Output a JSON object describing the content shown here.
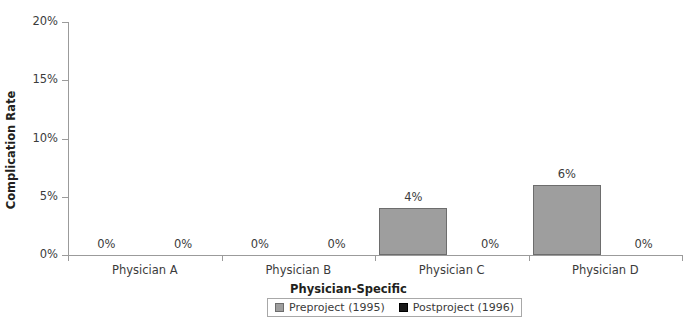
{
  "chart_data": {
    "type": "bar",
    "title": "",
    "xlabel": "Physician-Specific",
    "ylabel": "Complication Rate",
    "categories": [
      "Physician A",
      "Physician B",
      "Physician C",
      "Physician D"
    ],
    "series": [
      {
        "name": "Preproject (1995)",
        "color": "#9e9e9e",
        "values": [
          0,
          0,
          4,
          6
        ],
        "labels": [
          "0%",
          "0%",
          "4%",
          "6%"
        ]
      },
      {
        "name": "Postproject (1996)",
        "color": "#1a1a1a",
        "values": [
          0,
          0,
          0,
          0
        ],
        "labels": [
          "0%",
          "0%",
          "0%",
          "0%"
        ]
      }
    ],
    "ylim": [
      0,
      20
    ],
    "ytick_values": [
      0,
      5,
      10,
      15,
      20
    ],
    "ytick_labels": [
      "0%",
      "5%",
      "10%",
      "15%",
      "20%"
    ],
    "grid": false,
    "legend_position": "bottom-center",
    "value_labels_shown": true,
    "units": "percent"
  },
  "axes": {
    "y_title": "Complication Rate",
    "x_title": "Physician-Specific",
    "y_ticks": [
      {
        "label": "20%",
        "value": 20
      },
      {
        "label": "15%",
        "value": 15
      },
      {
        "label": "10%",
        "value": 10
      },
      {
        "label": "5%",
        "value": 5
      },
      {
        "label": "0%",
        "value": 0
      }
    ]
  },
  "legend": {
    "items": [
      {
        "label": "Preproject (1995)",
        "swatch": "gray-swatch"
      },
      {
        "label": "Postproject (1996)",
        "swatch": "black-swatch"
      }
    ]
  },
  "colors": {
    "background": "#ffffff",
    "axis": "#9b9b9b",
    "text": "#3b3b3b",
    "title_text": "#231f20",
    "series_pre": "#9e9e9e",
    "series_pre_border": "#6d6d6d",
    "series_post": "#1a1a1a"
  }
}
